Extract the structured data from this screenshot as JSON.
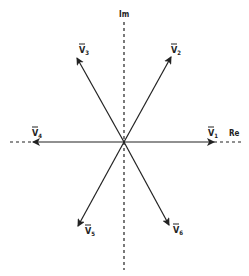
{
  "diagram": {
    "type": "phasor-diagram",
    "center": [
      124,
      142
    ],
    "axes": {
      "imag_label": "Im",
      "real_label": "Re"
    },
    "vectors": [
      {
        "id": "v1",
        "label": "V",
        "subscript": "1",
        "angle_deg": 0
      },
      {
        "id": "v2",
        "label": "V",
        "subscript": "2",
        "angle_deg": 60
      },
      {
        "id": "v3",
        "label": "V",
        "subscript": "3",
        "angle_deg": 120
      },
      {
        "id": "v4",
        "label": "V",
        "subscript": "4",
        "angle_deg": 180
      },
      {
        "id": "v5",
        "label": "V",
        "subscript": "5",
        "angle_deg": 240
      },
      {
        "id": "v6",
        "label": "V",
        "subscript": "6",
        "angle_deg": 300
      }
    ],
    "colors": {
      "line": "#222222",
      "background": "#ffffff"
    }
  }
}
